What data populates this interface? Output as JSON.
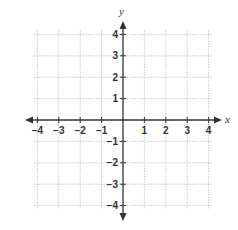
{
  "figure": {
    "type": "coordinate-plane",
    "x_axis_label": "x",
    "y_axis_label": "y",
    "x_range": [
      -4,
      4
    ],
    "y_range": [
      -4,
      4
    ],
    "grid": "dotted",
    "colors": {
      "axis": "#333333",
      "grid": "#b0b0b0",
      "text": "#333333"
    }
  },
  "x_ticks": [
    {
      "value": -4,
      "label": "−4"
    },
    {
      "value": -3,
      "label": "−3"
    },
    {
      "value": -2,
      "label": "−2"
    },
    {
      "value": -1,
      "label": "−1"
    },
    {
      "value": 1,
      "label": "1"
    },
    {
      "value": 2,
      "label": "2"
    },
    {
      "value": 3,
      "label": "3"
    },
    {
      "value": 4,
      "label": "4"
    }
  ],
  "y_ticks": [
    {
      "value": 4,
      "label": "4"
    },
    {
      "value": 3,
      "label": "3"
    },
    {
      "value": 2,
      "label": "2"
    },
    {
      "value": 1,
      "label": "1"
    },
    {
      "value": -1,
      "label": "−1"
    },
    {
      "value": -2,
      "label": "−2"
    },
    {
      "value": -3,
      "label": "−3"
    },
    {
      "value": -4,
      "label": "−4"
    }
  ]
}
